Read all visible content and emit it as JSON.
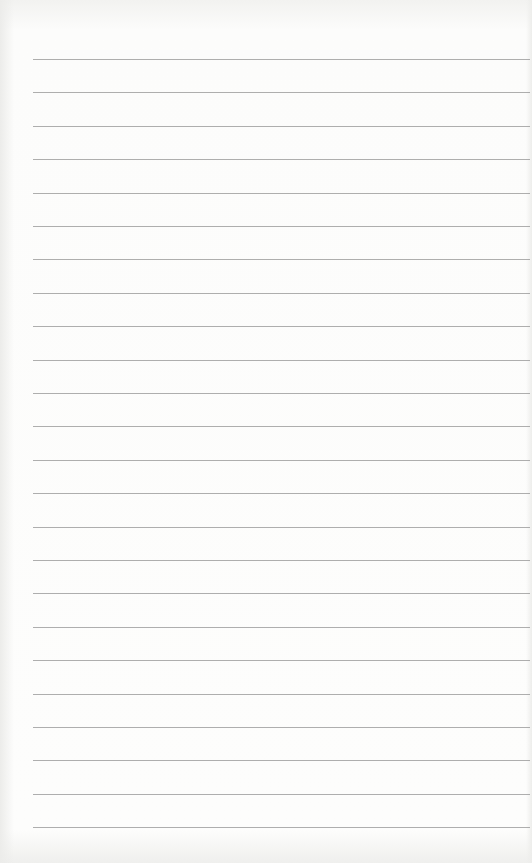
{
  "page": {
    "type": "blank lined paper",
    "line_count": 24,
    "line_color": "#9a9a9a",
    "background_color": "#fcfcfb",
    "first_line_y": 59,
    "line_spacing": 33.4
  }
}
